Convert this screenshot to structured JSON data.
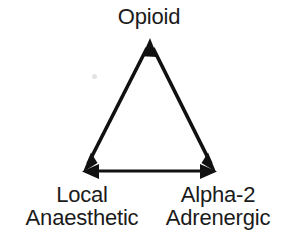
{
  "figure": {
    "type": "triangle-relationship-diagram",
    "background_color": "#ffffff",
    "stroke_color": "#111111",
    "text_color": "#1b1b1b",
    "nodes": [
      {
        "id": "opioid",
        "label": "Opioid",
        "lines": [
          "Opioid"
        ],
        "position": "top-apex"
      },
      {
        "id": "local-anaesthetic",
        "label": "Local Anaesthetic",
        "lines": [
          "Local",
          "Anaesthetic"
        ],
        "position": "bottom-left"
      },
      {
        "id": "alpha-2-adrenergic",
        "label": "Alpha-2 Adrenergic",
        "lines": [
          "Alpha-2",
          "Adrenergic"
        ],
        "position": "bottom-right"
      }
    ],
    "edges": [
      {
        "id": "edge-local-opioid",
        "from": "local-anaesthetic",
        "to": "opioid",
        "arrowheads": "both"
      },
      {
        "id": "edge-opioid-alpha2",
        "from": "opioid",
        "to": "alpha-2-adrenergic",
        "arrowheads": "both"
      },
      {
        "id": "edge-local-alpha2",
        "from": "local-anaesthetic",
        "to": "alpha-2-adrenergic",
        "arrowheads": "both"
      }
    ]
  }
}
